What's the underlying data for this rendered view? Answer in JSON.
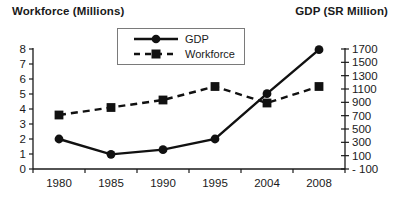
{
  "titles": {
    "left": "Workforce (Millions)",
    "right": "GDP (SR Million)"
  },
  "legend": {
    "items": [
      {
        "label": "GDP",
        "marker": "circle",
        "line_style": "solid"
      },
      {
        "label": "Workforce",
        "marker": "square",
        "line_style": "dashed"
      }
    ]
  },
  "chart_data": {
    "type": "line",
    "categories": [
      "1980",
      "1985",
      "1990",
      "1995",
      "2004",
      "2008"
    ],
    "series": [
      {
        "name": "GDP",
        "axis": "right",
        "marker": "circle",
        "line_style": "solid",
        "values": [
          350,
          120,
          190,
          350,
          1030,
          1690
        ]
      },
      {
        "name": "Workforce",
        "axis": "left",
        "marker": "square",
        "line_style": "dashed",
        "values": [
          3.6,
          4.1,
          4.6,
          5.5,
          4.4,
          5.5
        ]
      }
    ],
    "left_axis": {
      "label": "Workforce (Millions)",
      "range": [
        0,
        8
      ],
      "ticks": [
        0,
        1,
        2,
        3,
        4,
        5,
        6,
        7,
        8
      ],
      "tick_labels": [
        "0",
        "1",
        "2",
        "3",
        "4",
        "5",
        "6",
        "7",
        "8"
      ]
    },
    "right_axis": {
      "label": "GDP (SR Million)",
      "range": [
        -100,
        1700
      ],
      "ticks": [
        -100,
        100,
        300,
        500,
        700,
        900,
        1100,
        1300,
        1500,
        1700
      ],
      "tick_labels": [
        "- 100",
        "100",
        "300",
        "500",
        "700",
        "900",
        "1100",
        "1300",
        "1500",
        "1700"
      ]
    },
    "grid": false,
    "legend_position": "top-center",
    "colors": {
      "series": "#111111",
      "axis": "#1a1a1a",
      "background": "#ffffff"
    }
  }
}
